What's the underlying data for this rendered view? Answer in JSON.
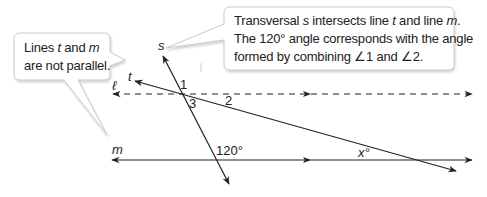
{
  "callouts": {
    "left": {
      "line1_a": "Lines ",
      "line1_t": "t",
      "line1_b": " and ",
      "line1_m": "m",
      "line2": "are not parallel."
    },
    "right": {
      "line1_a": "Transversal ",
      "line1_s": "s",
      "line1_b": " intersects line ",
      "line1_t": "t",
      "line1_c": " and line ",
      "line1_m": "m",
      "line1_d": ".",
      "line2": "The 120° angle corresponds with the angle",
      "line3": "formed by combining ∠1 and ∠2."
    }
  },
  "lines": {
    "s": "s",
    "t": "t",
    "l": "ℓ",
    "m": "m"
  },
  "angles": {
    "a1": "1",
    "a2": "2",
    "a3": "3",
    "a120": "120°",
    "x": "x°"
  },
  "colors": {
    "line": "#222222",
    "callout_border": "#c8c8c8",
    "callout_fill": "#ffffff"
  }
}
